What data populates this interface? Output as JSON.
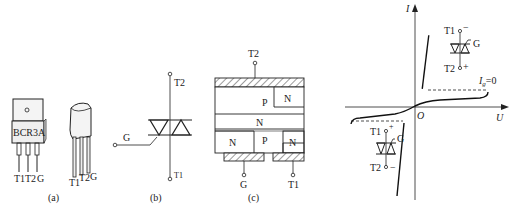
{
  "figure": {
    "panels": [
      {
        "id": "a",
        "caption": "(a)",
        "description": "Package photos of triac",
        "package1": {
          "marking": "BCR3A",
          "pins": [
            "T1",
            "T2",
            "G"
          ]
        },
        "package2": {
          "pins": [
            "T1",
            "T2",
            "G"
          ]
        }
      },
      {
        "id": "b",
        "caption": "(b)",
        "description": "Triac circuit symbol",
        "terminals": {
          "top": "T2",
          "bottom": "T1",
          "gate": "G"
        }
      },
      {
        "id": "c",
        "caption": "(c)",
        "description": "Internal layer structure",
        "terminals": {
          "top": "T2",
          "bottom_left": "G",
          "bottom_right": "T1"
        },
        "layers": {
          "upper_p": "P",
          "upper_n": "N",
          "middle_n": "N",
          "lower_n_left": "N",
          "lower_p": "P",
          "lower_n_right": "N"
        }
      },
      {
        "id": "d",
        "description": "Volt-ampere characteristic",
        "axes": {
          "y_label": "I",
          "x_label": "U",
          "origin": "O"
        },
        "curve_label": "I",
        "curve_label_sub": "g",
        "curve_label_value": "=0",
        "quadrant1_symbol": {
          "top": "T1",
          "top_sign": "−",
          "bottom": "T2",
          "bottom_sign": "+",
          "gate": "G"
        },
        "quadrant3_symbol": {
          "top": "T1",
          "top_sign": "+",
          "bottom": "T2",
          "bottom_sign": "−",
          "gate": "G"
        }
      }
    ]
  }
}
